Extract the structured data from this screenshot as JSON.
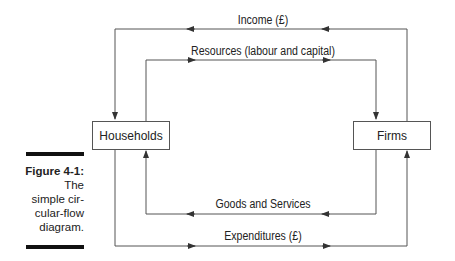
{
  "diagram": {
    "nodes": {
      "households": "Households",
      "firms": "Firms"
    },
    "flows": {
      "income": "Income (£)",
      "resources": "Resources (labour and capital)",
      "goods": "Goods and Services",
      "expenditures": "Expenditures (£)"
    }
  },
  "caption": {
    "figure_label": "Figure 4-1:",
    "lines": [
      "The",
      "simple cir-",
      "cular-flow",
      "diagram."
    ]
  },
  "colors": {
    "line": "#555555",
    "bar": "#111111"
  }
}
